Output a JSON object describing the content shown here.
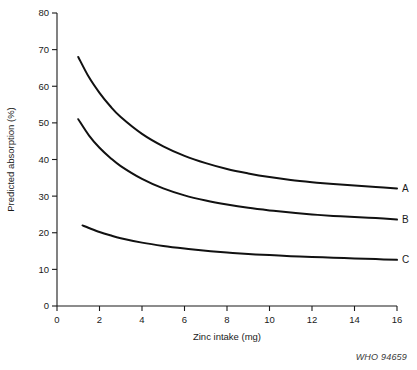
{
  "credit": "WHO 94659",
  "chart_data": {
    "type": "line",
    "title": "",
    "xlabel": "Zinc intake (mg)",
    "ylabel": "Predicted absorption (%)",
    "xlim": [
      0,
      16
    ],
    "ylim": [
      0,
      80
    ],
    "xticks": [
      0,
      2,
      4,
      6,
      8,
      10,
      12,
      14,
      16
    ],
    "yticks": [
      0,
      10,
      20,
      30,
      40,
      50,
      60,
      70,
      80
    ],
    "grid": false,
    "legend_position": "right-of-curve-ends",
    "line_color": "#111111",
    "series": [
      {
        "name": "A",
        "label": "A",
        "x": [
          1.0,
          1.5,
          2.0,
          2.5,
          3.0,
          4.0,
          5.0,
          6.0,
          7.0,
          8.0,
          9.0,
          10.0,
          11.0,
          12.0,
          13.0,
          14.0,
          15.0,
          16.0
        ],
        "values": [
          68.0,
          62.5,
          58.2,
          54.6,
          51.6,
          47.0,
          43.6,
          41.0,
          39.0,
          37.4,
          36.2,
          35.2,
          34.4,
          33.8,
          33.3,
          32.9,
          32.5,
          32.1
        ]
      },
      {
        "name": "B",
        "label": "B",
        "x": [
          1.0,
          1.5,
          2.0,
          2.5,
          3.0,
          4.0,
          5.0,
          6.0,
          7.0,
          8.0,
          9.0,
          10.0,
          11.0,
          12.0,
          13.0,
          14.0,
          15.0,
          16.0
        ],
        "values": [
          51.0,
          46.6,
          43.2,
          40.5,
          38.2,
          34.7,
          32.1,
          30.2,
          28.8,
          27.7,
          26.8,
          26.1,
          25.5,
          25.0,
          24.6,
          24.3,
          24.0,
          23.6
        ]
      },
      {
        "name": "C",
        "label": "C",
        "x": [
          1.2,
          1.5,
          2.0,
          2.5,
          3.0,
          4.0,
          5.0,
          6.0,
          7.0,
          8.0,
          9.0,
          10.0,
          11.0,
          12.0,
          13.0,
          14.0,
          15.0,
          16.0
        ],
        "values": [
          22.0,
          21.3,
          20.2,
          19.3,
          18.5,
          17.3,
          16.4,
          15.7,
          15.1,
          14.6,
          14.2,
          13.9,
          13.6,
          13.4,
          13.2,
          13.0,
          12.8,
          12.6
        ]
      }
    ]
  }
}
